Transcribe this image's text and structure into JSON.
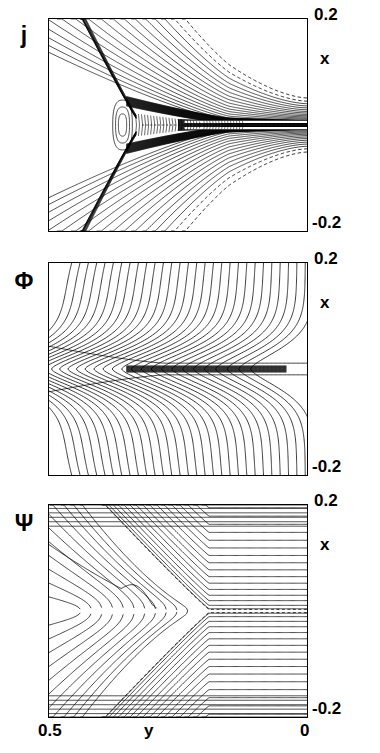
{
  "figure": {
    "panels": [
      {
        "symbol": "j",
        "symbol_name": "current-density",
        "y_top_label": "0.2",
        "y_bottom_label": "-0.2",
        "y_axis_name": "x"
      },
      {
        "symbol": "Φ",
        "symbol_name": "stream-function-phi",
        "y_top_label": "0.2",
        "y_bottom_label": "-0.2",
        "y_axis_name": "x"
      },
      {
        "symbol": "Ψ",
        "symbol_name": "flux-function-psi",
        "y_top_label": "0.2",
        "y_bottom_label": "-0.2",
        "y_axis_name": "x"
      }
    ],
    "x_axis": {
      "left_label": "0.5",
      "right_label": "0",
      "name": "y"
    },
    "colors": {
      "line": "#000000",
      "background": "#ffffff"
    }
  },
  "chart_data": {
    "type": "line",
    "title": "",
    "subtitle": "",
    "xlabel": "y",
    "ylabel": "x",
    "xlim": [
      0.5,
      0.0
    ],
    "ylim": [
      -0.2,
      0.2
    ],
    "x_ticks": [
      0.5,
      0.0
    ],
    "x_tick_labels": [
      "0.5",
      "0"
    ],
    "y_ticks": [
      0.2,
      -0.2
    ],
    "y_tick_labels": [
      "0.2",
      "-0.2"
    ],
    "x_axis_reversed": true,
    "grid": false,
    "legend": null,
    "panels": [
      {
        "name": "j",
        "quantity": "current density",
        "contour_style": "solid positive, dashed negative",
        "n_contours": 34,
        "features": [
          "narrow intense current sheet along x = 0 extending to y = 0",
          "small closed O-point island near y = 0.36, x = 0",
          "two separatrix arms fanning to upper-left and lower-left",
          "dashed outer contours above and below the sheet at right"
        ]
      },
      {
        "name": "Φ",
        "quantity": "stream function",
        "contour_style": "solid",
        "n_contours": 30,
        "features": [
          "stagnation point flow converging on the midplane x = 0",
          "near-vertical contours at right and upper-left",
          "dense dark band along x = 0 between y = 0.30 and y = 0.05"
        ]
      },
      {
        "name": "Ψ",
        "quantity": "magnetic flux function",
        "contour_style": "solid closed field lines, dashed separatrix",
        "n_contours": 40,
        "features": [
          "X-point / cusp geometry opening toward y = 0",
          "dashed separatrix pair along x = 0 from y ≈ 0.25 to y = 0",
          "nested C-shaped flux surfaces wrapping the island on the left",
          "uniform horizontal field lines far above and below"
        ]
      }
    ]
  }
}
